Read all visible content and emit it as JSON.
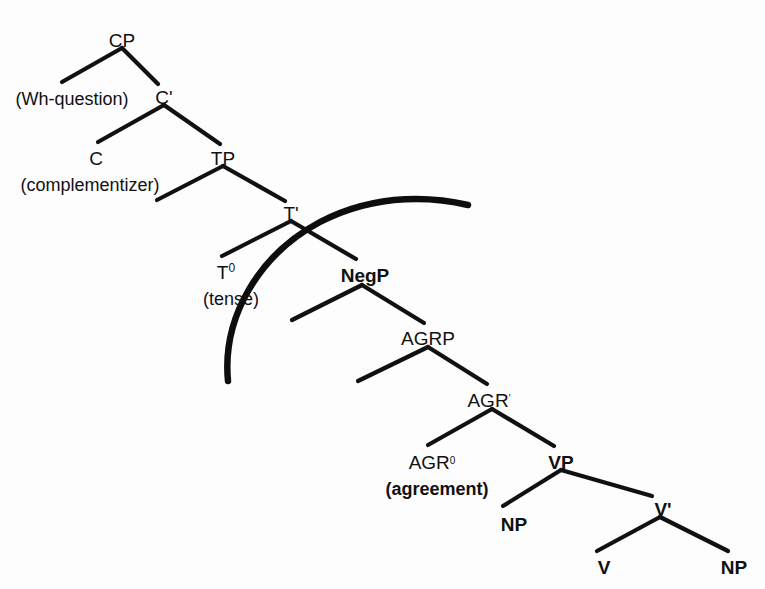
{
  "diagram": {
    "background_color": "#ffffff",
    "line_color": "#111111",
    "arc_color": "#0d0d0d",
    "nodes": [
      {
        "id": "cp",
        "label": "CP",
        "bold": false,
        "x": 122,
        "y": 40,
        "sup": ""
      },
      {
        "id": "cbar",
        "label": "C'",
        "bold": false,
        "x": 164,
        "y": 97,
        "sup": ""
      },
      {
        "id": "c",
        "label": "C",
        "bold": false,
        "x": 96,
        "y": 158,
        "sup": ""
      },
      {
        "id": "tp",
        "label": "TP",
        "bold": false,
        "x": 223,
        "y": 158,
        "sup": ""
      },
      {
        "id": "tbar",
        "label": "T'",
        "bold": false,
        "x": 291,
        "y": 213,
        "sup": ""
      },
      {
        "id": "t0",
        "label": "T",
        "bold": false,
        "x": 226,
        "y": 272,
        "sup": "0"
      },
      {
        "id": "negp",
        "label": "NegP",
        "bold": true,
        "x": 365,
        "y": 275,
        "sup": ""
      },
      {
        "id": "agrp",
        "label": "AGRP",
        "bold": false,
        "x": 428,
        "y": 338,
        "sup": ""
      },
      {
        "id": "agrbar",
        "label": "AGR",
        "bold": false,
        "x": 489,
        "y": 400,
        "sup": "'"
      },
      {
        "id": "agr0",
        "label": "AGR",
        "bold": false,
        "x": 432,
        "y": 462,
        "sup": "0"
      },
      {
        "id": "vp",
        "label": "VP",
        "bold": true,
        "x": 561,
        "y": 462,
        "sup": ""
      },
      {
        "id": "np1",
        "label": "NP",
        "bold": true,
        "x": 514,
        "y": 524,
        "sup": ""
      },
      {
        "id": "vbar",
        "label": "V'",
        "bold": true,
        "x": 663,
        "y": 509,
        "sup": ""
      },
      {
        "id": "v",
        "label": "V",
        "bold": true,
        "x": 604,
        "y": 567,
        "sup": ""
      },
      {
        "id": "np2",
        "label": "NP",
        "bold": true,
        "x": 734,
        "y": 567,
        "sup": ""
      }
    ],
    "glosses": [
      {
        "id": "wh-question-gloss",
        "label": "(Wh-question)",
        "bold": false,
        "x": 72,
        "y": 98
      },
      {
        "id": "complementizer-gloss",
        "label": "(complementizer)",
        "bold": false,
        "x": 90,
        "y": 184
      },
      {
        "id": "tense-gloss",
        "label": "(tense)",
        "bold": false,
        "x": 231,
        "y": 298
      },
      {
        "id": "agreement-gloss",
        "label": "(agreement)",
        "bold": true,
        "x": 437,
        "y": 488
      }
    ],
    "branches": [
      {
        "id": "cp-left",
        "from": "cp",
        "to": "wh-question",
        "x1": 122,
        "y1": 48,
        "x2": 62,
        "y2": 82
      },
      {
        "id": "cp-right",
        "from": "cp",
        "to": "cbar",
        "x1": 122,
        "y1": 48,
        "x2": 158,
        "y2": 84
      },
      {
        "id": "cbar-left",
        "from": "cbar",
        "to": "c",
        "x1": 164,
        "y1": 105,
        "x2": 98,
        "y2": 142
      },
      {
        "id": "cbar-right",
        "from": "cbar",
        "to": "tp",
        "x1": 164,
        "y1": 105,
        "x2": 220,
        "y2": 144
      },
      {
        "id": "tp-left",
        "from": "tp",
        "to": "spec-tp",
        "x1": 223,
        "y1": 166,
        "x2": 157,
        "y2": 200
      },
      {
        "id": "tp-right",
        "from": "tp",
        "to": "tbar",
        "x1": 223,
        "y1": 166,
        "x2": 285,
        "y2": 201
      },
      {
        "id": "tbar-left",
        "from": "tbar",
        "to": "t0",
        "x1": 291,
        "y1": 221,
        "x2": 222,
        "y2": 256
      },
      {
        "id": "tbar-right",
        "from": "tbar",
        "to": "negp",
        "x1": 291,
        "y1": 221,
        "x2": 356,
        "y2": 259
      },
      {
        "id": "negp-left",
        "from": "negp",
        "to": "spec-negp",
        "x1": 362,
        "y1": 285,
        "x2": 292,
        "y2": 320
      },
      {
        "id": "negp-right",
        "from": "negp",
        "to": "agrp",
        "x1": 362,
        "y1": 285,
        "x2": 424,
        "y2": 323
      },
      {
        "id": "agrp-left",
        "from": "agrp",
        "to": "spec-agrp",
        "x1": 428,
        "y1": 347,
        "x2": 358,
        "y2": 381
      },
      {
        "id": "agrp-right",
        "from": "agrp",
        "to": "agrbar",
        "x1": 428,
        "y1": 347,
        "x2": 487,
        "y2": 384
      },
      {
        "id": "agrbar-left",
        "from": "agrbar",
        "to": "agr0",
        "x1": 492,
        "y1": 409,
        "x2": 428,
        "y2": 445
      },
      {
        "id": "agrbar-right",
        "from": "agrbar",
        "to": "vp",
        "x1": 492,
        "y1": 409,
        "x2": 554,
        "y2": 446
      },
      {
        "id": "vp-left",
        "from": "vp",
        "to": "np1",
        "x1": 561,
        "y1": 470,
        "x2": 503,
        "y2": 506
      },
      {
        "id": "vp-right",
        "from": "vp",
        "to": "vbar",
        "x1": 561,
        "y1": 470,
        "x2": 652,
        "y2": 496
      },
      {
        "id": "vbar-left",
        "from": "vbar",
        "to": "v",
        "x1": 660,
        "y1": 517,
        "x2": 597,
        "y2": 551
      },
      {
        "id": "vbar-right",
        "from": "vbar",
        "to": "np2",
        "x1": 660,
        "y1": 517,
        "x2": 728,
        "y2": 551
      }
    ],
    "arc": {
      "id": "scope-arc",
      "description": "thick curved arc crossing the T-bar / NegP branches",
      "path": "M 228 381 C 222 318, 258 255, 320 222 C 380 191, 438 198, 468 205"
    }
  }
}
